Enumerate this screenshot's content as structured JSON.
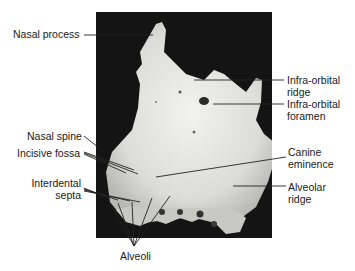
{
  "figure": {
    "labels_left": [
      {
        "id": "nasal-process",
        "text": "Nasal process"
      },
      {
        "id": "nasal-spine",
        "text": "Nasal spine"
      },
      {
        "id": "incisive-fossa",
        "text": "Incisive fossa"
      },
      {
        "id": "interdental-septa",
        "text": "Interdental\nsepta"
      }
    ],
    "labels_right": [
      {
        "id": "infra-orbital-ridge",
        "text": "Infra-orbital\nridge"
      },
      {
        "id": "infra-orbital-foramen",
        "text": "Infra-orbital\nforamen"
      },
      {
        "id": "canine-eminence",
        "text": "Canine\neminence"
      },
      {
        "id": "alveolar-ridge",
        "text": "Alveolar\nridge"
      }
    ],
    "labels_bottom": [
      {
        "id": "alveoli",
        "text": "Alveoli"
      }
    ]
  }
}
